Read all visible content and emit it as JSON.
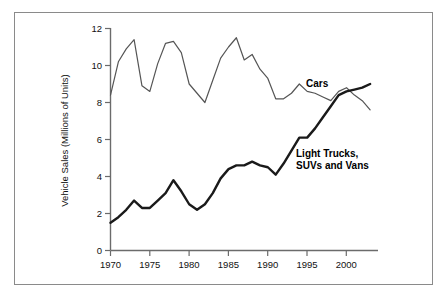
{
  "figure": {
    "background_color": "#ffffff",
    "frame_color": "#8a8a8a"
  },
  "axes": {
    "y_axis_title": "Vehicle Sales (Millions of Units)",
    "y_ticks": [
      "0",
      "2",
      "4",
      "6",
      "8",
      "10",
      "12"
    ],
    "x_ticks": [
      "1970",
      "1975",
      "1980",
      "1985",
      "1990",
      "1995",
      "2000"
    ]
  },
  "series_labels": {
    "cars": "Cars",
    "trucks_line1": "Light Trucks,",
    "trucks_line2": "SUVs and Vans"
  },
  "chart_data": {
    "type": "line",
    "title": "",
    "xlabel": "",
    "ylabel": "Vehicle Sales (Millions of Units)",
    "xlim": [
      1970,
      2004
    ],
    "ylim": [
      0,
      12
    ],
    "grid": false,
    "legend_position": "inline-annotations",
    "x_tick_values": [
      1970,
      1975,
      1980,
      1985,
      1990,
      1995,
      2000
    ],
    "y_tick_values": [
      0,
      2,
      4,
      6,
      8,
      10,
      12
    ],
    "x": [
      1970,
      1971,
      1972,
      1973,
      1974,
      1975,
      1976,
      1977,
      1978,
      1979,
      1980,
      1981,
      1982,
      1983,
      1984,
      1985,
      1986,
      1987,
      1988,
      1989,
      1990,
      1991,
      1992,
      1993,
      1994,
      1995,
      1996,
      1997,
      1998,
      1999,
      2000,
      2001,
      2002,
      2003
    ],
    "series": [
      {
        "name": "Cars",
        "color": "#555555",
        "line_width": 1.2,
        "values": [
          8.4,
          10.2,
          10.9,
          11.4,
          8.9,
          8.6,
          10.1,
          11.2,
          11.3,
          10.7,
          9.0,
          8.5,
          8.0,
          9.2,
          10.4,
          11.0,
          11.5,
          10.3,
          10.6,
          9.8,
          9.3,
          8.2,
          8.2,
          8.5,
          9.0,
          8.6,
          8.5,
          8.3,
          8.1,
          8.6,
          8.8,
          8.4,
          8.1,
          7.6
        ]
      },
      {
        "name": "Light Trucks, SUVs and Vans",
        "color": "#1a1a1a",
        "line_width": 2.4,
        "values": [
          1.5,
          1.8,
          2.2,
          2.7,
          2.3,
          2.3,
          2.7,
          3.1,
          3.8,
          3.2,
          2.5,
          2.2,
          2.5,
          3.1,
          3.9,
          4.4,
          4.6,
          4.6,
          4.8,
          4.6,
          4.5,
          4.1,
          4.7,
          5.4,
          6.1,
          6.1,
          6.6,
          7.2,
          7.8,
          8.4,
          8.6,
          8.7,
          8.8,
          9.0
        ]
      }
    ]
  }
}
